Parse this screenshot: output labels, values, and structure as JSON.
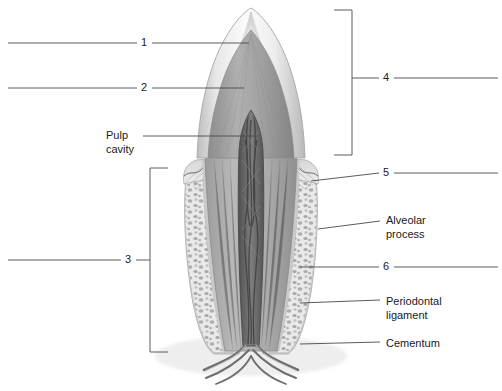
{
  "figure": {
    "background_color": "#ffffff",
    "line_color": "#4a4a4a",
    "text_color": "#1a1a1a"
  },
  "numbered_labels": [
    {
      "id": "1",
      "text": "1",
      "side": "left",
      "x": 144,
      "y": 43,
      "leader": {
        "x1": 8,
        "y1": 43,
        "x2": 249,
        "y2": 43
      }
    },
    {
      "id": "2",
      "text": "2",
      "side": "left",
      "x": 144,
      "y": 88,
      "leader": {
        "x1": 8,
        "y1": 88,
        "x2": 244,
        "y2": 88
      }
    },
    {
      "id": "3",
      "text": "3",
      "side": "left",
      "x": 128,
      "y": 260,
      "bracket": {
        "x": 150,
        "y_top": 168,
        "y_bottom": 352,
        "tick": 18,
        "dir": "right"
      },
      "leader": {
        "x1": 8,
        "y1": 260,
        "x2": 150,
        "y2": 260
      }
    },
    {
      "id": "4",
      "text": "4",
      "side": "right",
      "x": 386,
      "y": 78,
      "bracket": {
        "x": 352,
        "y_top": 10,
        "y_bottom": 155,
        "tick": 18,
        "dir": "left"
      },
      "leader": {
        "x1": 352,
        "y1": 78,
        "x2": 498,
        "y2": 78
      }
    },
    {
      "id": "5",
      "text": "5",
      "side": "right",
      "x": 386,
      "y": 174,
      "leader": {
        "x1": 311,
        "y1": 180,
        "x2": 498,
        "y2": 173
      }
    },
    {
      "id": "6",
      "text": "6",
      "side": "right",
      "x": 386,
      "y": 267,
      "leader": {
        "x1": 300,
        "y1": 267,
        "x2": 498,
        "y2": 267
      }
    }
  ],
  "text_labels": [
    {
      "id": "pulp-cavity",
      "lines": [
        "Pulp",
        "cavity"
      ],
      "side": "left",
      "x": 106,
      "y": 130,
      "leader": {
        "x1": 143,
        "y1": 136,
        "x2": 258,
        "y2": 136
      }
    },
    {
      "id": "alveolar-process",
      "lines": [
        "Alveolar",
        "process"
      ],
      "side": "right",
      "x": 386,
      "y": 214,
      "leader": {
        "x1": 318,
        "y1": 228,
        "x2": 380,
        "y2": 220
      }
    },
    {
      "id": "periodontal-ligament",
      "lines": [
        "Periodontal",
        "ligament"
      ],
      "side": "right",
      "x": 386,
      "y": 294,
      "leader": {
        "x1": 300,
        "y1": 303,
        "x2": 380,
        "y2": 300
      }
    },
    {
      "id": "cementum",
      "lines": [
        "Cementum"
      ],
      "side": "right",
      "x": 386,
      "y": 338,
      "leader": {
        "x1": 300,
        "y1": 344,
        "x2": 380,
        "y2": 342
      }
    }
  ],
  "anatomy_parts": [
    {
      "name": "enamel",
      "tone": "#f2f2f2"
    },
    {
      "name": "dentin",
      "tone": "#9a9a9a"
    },
    {
      "name": "pulp-cavity",
      "tone": "#6a6a6a"
    },
    {
      "name": "gingiva",
      "tone": "#c8c8c8"
    },
    {
      "name": "cementum",
      "tone": "#b4b4b4"
    },
    {
      "name": "periodontal-ligament",
      "tone": "#dedede"
    },
    {
      "name": "alveolar-bone",
      "tone": "#cfcfcf"
    },
    {
      "name": "blood-vessels-nerves",
      "tone": "#777777"
    }
  ]
}
